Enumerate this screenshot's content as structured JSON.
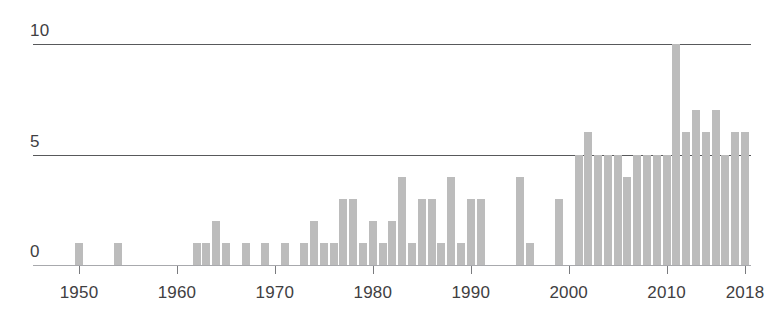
{
  "chart_data": {
    "type": "bar",
    "title": "",
    "subtitle": "",
    "xlabel": "",
    "ylabel": "",
    "xlim": [
      1948,
      2019
    ],
    "ylim": [
      0,
      10
    ],
    "grid": true,
    "legend": null,
    "bar_color": "#bcbcbc",
    "axis_color": "#58595b",
    "y_ticks": [
      0,
      5,
      10
    ],
    "y_tick_labels": [
      "0",
      "5",
      "10"
    ],
    "x_ticks": [
      1950,
      1960,
      1970,
      1980,
      1990,
      2000,
      2010,
      2018
    ],
    "x_tick_labels": [
      "1950",
      "1960",
      "1970",
      "1980",
      "1990",
      "2000",
      "2010",
      "2018"
    ],
    "categories": [
      1950,
      1951,
      1952,
      1953,
      1954,
      1955,
      1956,
      1957,
      1958,
      1959,
      1960,
      1961,
      1962,
      1963,
      1964,
      1965,
      1966,
      1967,
      1968,
      1969,
      1970,
      1971,
      1972,
      1973,
      1974,
      1975,
      1976,
      1977,
      1978,
      1979,
      1980,
      1981,
      1982,
      1983,
      1984,
      1985,
      1986,
      1987,
      1988,
      1989,
      1990,
      1991,
      1992,
      1993,
      1994,
      1995,
      1996,
      1997,
      1998,
      1999,
      2000,
      2001,
      2002,
      2003,
      2004,
      2005,
      2006,
      2007,
      2008,
      2009,
      2010,
      2011,
      2012,
      2013,
      2014,
      2015,
      2016,
      2017,
      2018
    ],
    "values": [
      1,
      0,
      0,
      0,
      1,
      0,
      0,
      0,
      0,
      0,
      0,
      0,
      1,
      1,
      2,
      1,
      0,
      1,
      0,
      1,
      0,
      1,
      0,
      1,
      2,
      1,
      1,
      3,
      3,
      1,
      2,
      1,
      2,
      4,
      1,
      3,
      3,
      1,
      4,
      1,
      3,
      3,
      0,
      0,
      0,
      4,
      1,
      0,
      0,
      3,
      0,
      5,
      6,
      5,
      5,
      5,
      4,
      5,
      5,
      5,
      5,
      10,
      6,
      7,
      6,
      7,
      5,
      6,
      6
    ]
  }
}
